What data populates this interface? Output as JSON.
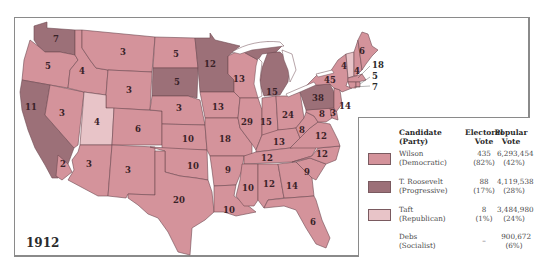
{
  "title": "1912",
  "colors": {
    "wilson": "#d4939b",
    "roosevelt": "#9c7078",
    "taft": "#e8c4c8",
    "border": "#6f4a52",
    "water": "#ffffff"
  },
  "legend": {
    "headers": {
      "candidate": "Candidate",
      "candidate_sub": "(Party)",
      "electoral": "Electoral",
      "electoral_sub": "Vote",
      "popular": "Popular",
      "popular_sub": "Vote"
    },
    "rows": [
      {
        "candidate": "Wilson",
        "party": "(Democratic)",
        "electoral": "435",
        "electoral_pct": "(82%)",
        "popular": "6,293,454",
        "popular_pct": "(42%)",
        "color": "#d4939b"
      },
      {
        "candidate": "T. Roosevelt",
        "party": "(Progressive)",
        "electoral": "88",
        "electoral_pct": "(17%)",
        "popular": "4,119,538",
        "popular_pct": "(28%)",
        "color": "#9c7078"
      },
      {
        "candidate": "Taft",
        "party": "(Republican)",
        "electoral": "8",
        "electoral_pct": "(1%)",
        "popular": "3,484,980",
        "popular_pct": "(24%)",
        "color": "#e8c4c8"
      },
      {
        "candidate": "Debs",
        "party": "(Socialist)",
        "electoral": "–",
        "electoral_pct": "",
        "popular": "900,672",
        "popular_pct": "(6%)",
        "color": null
      }
    ]
  },
  "states": {
    "WA": {
      "ev": "7",
      "winner": "roosevelt"
    },
    "OR": {
      "ev": "5",
      "winner": "wilson"
    },
    "CA": {
      "ev": "11",
      "winner": "roosevelt"
    },
    "CA_south": {
      "ev": "2",
      "winner": "wilson"
    },
    "ID": {
      "ev": "4",
      "winner": "wilson"
    },
    "NV": {
      "ev": "3",
      "winner": "wilson"
    },
    "UT": {
      "ev": "4",
      "winner": "taft"
    },
    "AZ": {
      "ev": "3",
      "winner": "wilson"
    },
    "MT": {
      "ev": "3",
      "winner": "wilson"
    },
    "WY": {
      "ev": "3",
      "winner": "wilson"
    },
    "CO": {
      "ev": "6",
      "winner": "wilson"
    },
    "NM": {
      "ev": "3",
      "winner": "wilson"
    },
    "ND": {
      "ev": "5",
      "winner": "wilson"
    },
    "SD": {
      "ev": "5",
      "winner": "roosevelt"
    },
    "NE": {
      "ev": "3",
      "winner": "wilson"
    },
    "KS": {
      "ev": "10",
      "winner": "wilson"
    },
    "OK": {
      "ev": "10",
      "winner": "wilson"
    },
    "TX": {
      "ev": "20",
      "winner": "wilson"
    },
    "MN": {
      "ev": "12",
      "winner": "roosevelt"
    },
    "IA": {
      "ev": "13",
      "winner": "wilson"
    },
    "MO": {
      "ev": "18",
      "winner": "wilson"
    },
    "AR": {
      "ev": "9",
      "winner": "wilson"
    },
    "LA": {
      "ev": "10",
      "winner": "wilson"
    },
    "WI": {
      "ev": "13",
      "winner": "wilson"
    },
    "IL": {
      "ev": "29",
      "winner": "wilson"
    },
    "MI": {
      "ev": "15",
      "winner": "roosevelt"
    },
    "IN": {
      "ev": "15",
      "winner": "wilson"
    },
    "OH": {
      "ev": "24",
      "winner": "wilson"
    },
    "KY": {
      "ev": "13",
      "winner": "wilson"
    },
    "TN": {
      "ev": "12",
      "winner": "wilson"
    },
    "MS": {
      "ev": "10",
      "winner": "wilson"
    },
    "AL": {
      "ev": "12",
      "winner": "wilson"
    },
    "GA": {
      "ev": "14",
      "winner": "wilson"
    },
    "FL": {
      "ev": "6",
      "winner": "wilson"
    },
    "SC": {
      "ev": "9",
      "winner": "wilson"
    },
    "NC": {
      "ev": "12",
      "winner": "wilson"
    },
    "VA": {
      "ev": "12",
      "winner": "wilson"
    },
    "WV": {
      "ev": "8",
      "winner": "wilson"
    },
    "MD": {
      "ev": "8",
      "winner": "wilson"
    },
    "DE": {
      "ev": "3",
      "winner": "wilson"
    },
    "PA": {
      "ev": "38",
      "winner": "roosevelt"
    },
    "NJ": {
      "ev": "14",
      "winner": "wilson"
    },
    "NY": {
      "ev": "45",
      "winner": "wilson"
    },
    "VT": {
      "ev": "4",
      "winner": "taft"
    },
    "NH": {
      "ev": "4",
      "winner": "wilson"
    },
    "ME": {
      "ev": "6",
      "winner": "wilson"
    },
    "MA": {
      "ev": "18",
      "winner": "wilson"
    },
    "RI": {
      "ev": "5",
      "winner": "wilson"
    },
    "CT": {
      "ev": "7",
      "winner": "wilson"
    }
  }
}
